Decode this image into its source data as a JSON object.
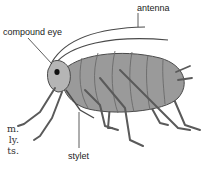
{
  "diagram": {
    "labels": {
      "compound_eye": "compound eye",
      "antenna": "antenna",
      "stylet": "stylet"
    },
    "side_text": [
      "m.",
      "ly.",
      "ts."
    ],
    "colors": {
      "body_fill": "#9a9a9a",
      "body_light": "#b5b5b5",
      "outline": "#4a4a4a",
      "leg": "#5a5a5a",
      "eye": "#111111",
      "leader_line": "#333333"
    }
  }
}
